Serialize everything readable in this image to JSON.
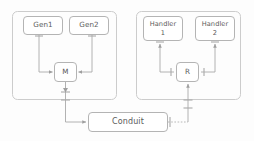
{
  "diagram": {
    "style": {
      "background": "#fdfdfd",
      "container_stroke": "#c9c9c9",
      "node_stroke": "#b4b4b4",
      "node_fill": "#ffffff",
      "line_stroke": "#a9a9a9",
      "text_color": "#5a5a5a",
      "dotted_stroke": "#b0b0b0"
    },
    "containers": [
      {
        "id": "left-panel",
        "label": "",
        "x": 12,
        "y": 11,
        "w": 105,
        "h": 89
      },
      {
        "id": "right-panel",
        "label": "",
        "x": 136,
        "y": 11,
        "w": 105,
        "h": 89
      }
    ],
    "nodes": [
      {
        "id": "gen1",
        "label": "Gen1",
        "x": 23,
        "y": 16,
        "w": 40,
        "h": 19
      },
      {
        "id": "gen2",
        "label": "Gen2",
        "x": 69,
        "y": 16,
        "w": 40,
        "h": 19
      },
      {
        "id": "m",
        "label": "M",
        "x": 54,
        "y": 62,
        "w": 23,
        "h": 20
      },
      {
        "id": "handler1",
        "label": "Handler\n1",
        "x": 143,
        "y": 16,
        "w": 40,
        "h": 25
      },
      {
        "id": "handler2",
        "label": "Handler\n2",
        "x": 195,
        "y": 16,
        "w": 40,
        "h": 25
      },
      {
        "id": "r",
        "label": "R",
        "x": 176,
        "y": 62,
        "w": 23,
        "h": 20
      },
      {
        "id": "conduit",
        "label": "Conduit",
        "x": 88,
        "y": 112,
        "w": 80,
        "h": 20
      }
    ],
    "edges": [
      {
        "id": "gen1-to-m",
        "from": "gen1",
        "to": "m",
        "style": "solid",
        "arrow": "to"
      },
      {
        "id": "gen2-to-m",
        "from": "gen2",
        "to": "m",
        "style": "solid",
        "arrow": "to"
      },
      {
        "id": "m-to-conduit",
        "from": "m",
        "to": "conduit",
        "style": "solid",
        "arrow": "to"
      },
      {
        "id": "r-to-handler1",
        "from": "r",
        "to": "handler1",
        "style": "solid",
        "arrow": "to"
      },
      {
        "id": "r-to-handler2",
        "from": "r",
        "to": "handler2",
        "style": "solid",
        "arrow": "to"
      },
      {
        "id": "conduit-to-r",
        "from": "conduit",
        "to": "r",
        "style": "dotted",
        "arrow": "to"
      }
    ]
  }
}
